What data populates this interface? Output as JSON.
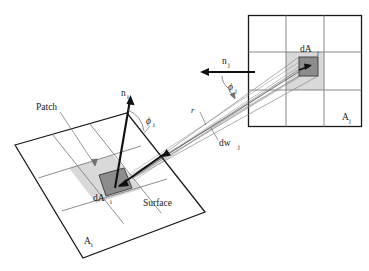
{
  "figure": {
    "background_color": "#ffffff"
  },
  "colors": {
    "outline": "#1a1a1a",
    "grid_line": "#7a7a7a",
    "patch_light_fill": "#d8d8d8",
    "patch_dark_fill": "#8c8c8c",
    "beam_line": "#8a8a8a",
    "leader_line": "#6f6f6f",
    "text": "#1a1a1a"
  },
  "labels": {
    "patch": "Patch",
    "surface": "Surface",
    "area_i": "A",
    "area_i_sub": "i",
    "area_j": "A",
    "area_j_sub": "j",
    "diff_area_i": "dA",
    "diff_area_i_sub": "i",
    "diff_area_j": "dA",
    "diff_area_j_sub": "j",
    "normal_i": "n",
    "normal_i_sub": "i",
    "normal_j": "n",
    "normal_j_sub": "j",
    "phi_i": "ϕ",
    "phi_i_sub": "i",
    "phi_j": "ϕ",
    "phi_j_sub": "j",
    "distance": "r",
    "solid_angle": "dw",
    "solid_angle_sub": "j"
  },
  "geometry": {
    "surface_i": {
      "name": "tilted-quad-surface-i",
      "corners": [
        [
          15,
          145
        ],
        [
          127,
          113
        ],
        [
          205,
          212
        ],
        [
          83,
          258
        ]
      ],
      "grid_divisions": 3
    },
    "surface_j": {
      "name": "axis-aligned-quad-surface-j",
      "bounds": [
        248,
        15,
        362,
        127
      ],
      "grid_divisions": 3
    },
    "patch_i_light": {
      "corners": [
        [
          69,
          168
        ],
        [
          113,
          155
        ],
        [
          141,
          189
        ],
        [
          96,
          203
        ]
      ]
    },
    "patch_i_dark": {
      "corners": [
        [
          99,
          175
        ],
        [
          124,
          168
        ],
        [
          132,
          188
        ],
        [
          106,
          196
        ]
      ]
    },
    "patch_j_light": {
      "bounds": [
        286,
        52,
        324,
        90
      ]
    },
    "patch_j_dark": {
      "bounds": [
        299,
        57,
        318,
        76
      ]
    },
    "normal_i_vector": {
      "from": [
        115,
        188
      ],
      "to": [
        131,
        96
      ]
    },
    "normal_j_vector": {
      "from": [
        253,
        72
      ],
      "to": [
        201,
        72
      ]
    },
    "beam": {
      "apex_i": [
        119,
        185
      ],
      "apex_j": [
        308,
        67
      ]
    }
  }
}
